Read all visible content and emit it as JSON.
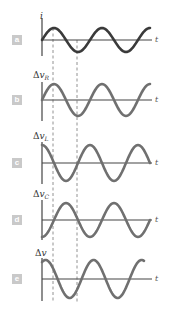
{
  "figure": {
    "time_axis_label": "t",
    "colors": {
      "current_curve": "#3a3a3a",
      "voltage_curve": "#707070",
      "axis": "#444444",
      "badge": "#c9c9c9",
      "dashed": "#777777"
    },
    "panels": [
      {
        "badge": "a",
        "ylabel_delta": "",
        "ylabel_var": "i",
        "ylabel_sub": "",
        "phase": "sin"
      },
      {
        "badge": "b",
        "ylabel_delta": "Δ",
        "ylabel_var": "v",
        "ylabel_sub": "R",
        "phase": "sin (in phase with i)"
      },
      {
        "badge": "c",
        "ylabel_delta": "Δ",
        "ylabel_var": "v",
        "ylabel_sub": "L",
        "phase": "cos (leads i by 90°)"
      },
      {
        "badge": "d",
        "ylabel_delta": "Δ",
        "ylabel_var": "v",
        "ylabel_sub": "C",
        "phase": "-cos (lags i by 90°)"
      },
      {
        "badge": "e",
        "ylabel_delta": "Δ",
        "ylabel_var": "v",
        "ylabel_sub": "",
        "phase": "sum (leads i by φ)"
      }
    ]
  }
}
